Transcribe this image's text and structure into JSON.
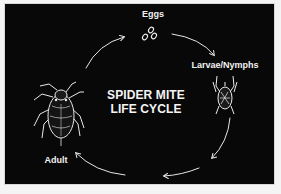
{
  "diagram": {
    "title_line1": "SPIDER MITE",
    "title_line2": "LIFE CYCLE",
    "stages": [
      {
        "label": "Eggs",
        "icon": "eggs-icon"
      },
      {
        "label": "Larvae/Nymphs",
        "icon": "larva-mite-icon"
      },
      {
        "label": "Adult",
        "icon": "adult-mite-icon"
      }
    ],
    "cycle_direction": "clockwise",
    "colors": {
      "background": "#080808",
      "foreground": "#f2f2f2",
      "page": "#f4f4f4"
    }
  }
}
